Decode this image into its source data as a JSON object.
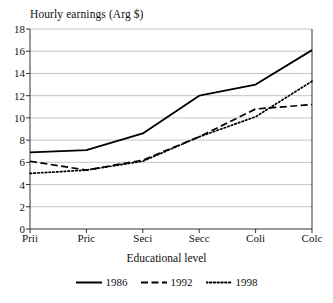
{
  "chart_data": {
    "type": "line",
    "title": "",
    "ylabel": "Hourly earnings (Arg $)",
    "xlabel": "Educational level",
    "categories": [
      "Prii",
      "Pric",
      "Seci",
      "Secc",
      "Coli",
      "Colc"
    ],
    "ylim": [
      0,
      18
    ],
    "yticks": [
      0,
      2,
      4,
      6,
      8,
      10,
      12,
      14,
      16,
      18
    ],
    "grid": "horizontal",
    "legend_position": "bottom",
    "series": [
      {
        "name": "1986",
        "style": "solid",
        "color": "#000000",
        "values": [
          6.9,
          7.1,
          8.6,
          12.0,
          13.0,
          16.1
        ]
      },
      {
        "name": "1992",
        "style": "dashed",
        "color": "#000000",
        "values": [
          6.1,
          5.3,
          6.2,
          8.3,
          10.8,
          11.2
        ]
      },
      {
        "name": "1998",
        "style": "dotted",
        "color": "#000000",
        "values": [
          5.0,
          5.3,
          6.1,
          8.3,
          10.1,
          13.3
        ]
      }
    ]
  },
  "axes": {
    "ytick_labels": [
      "18",
      "16",
      "14",
      "12",
      "10",
      "8",
      "6",
      "4",
      "2",
      "0"
    ],
    "xtick_labels": [
      "Prii",
      "Pric",
      "Seci",
      "Secc",
      "Coli",
      "Colc"
    ]
  },
  "legend": {
    "items": [
      {
        "label": "1986"
      },
      {
        "label": "1992"
      },
      {
        "label": "1998"
      }
    ]
  },
  "colors": {
    "ink": "#111111",
    "grid": "#b5b5b5",
    "axis": "#333333",
    "background": "#ffffff"
  }
}
